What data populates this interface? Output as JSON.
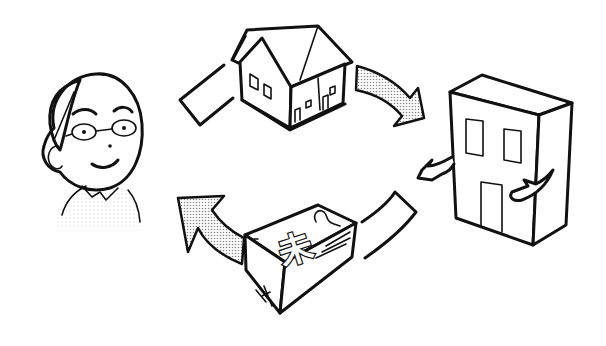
{
  "illustration": {
    "description": "Cycle diagram: person sells house to company, company pays money back to person",
    "elements": [
      {
        "name": "person",
        "label": "elderly man with glasses"
      },
      {
        "name": "house",
        "label": "house"
      },
      {
        "name": "building",
        "label": "company building with arms"
      },
      {
        "name": "money-bundle",
        "label": "bundle of cash"
      }
    ],
    "money_glyph": "未",
    "colors": {
      "ink": "#111111",
      "background": "#ffffff",
      "stipple": "#9a9a9a"
    }
  }
}
